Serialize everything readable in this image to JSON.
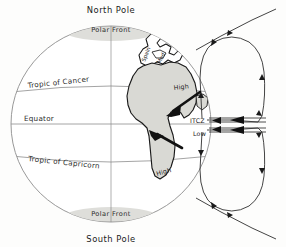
{
  "diagram": {
    "poles": {
      "north": "North Pole",
      "south": "South Pole"
    },
    "fronts": {
      "north_label": "Polar Front",
      "south_label": "Polar Front"
    },
    "latitudes": [
      {
        "id": "tropic-cancer",
        "label": "Tropic of Cancer"
      },
      {
        "id": "equator",
        "label": "Equator"
      },
      {
        "id": "tropic-capricorn",
        "label": "Tropic of Capricorn"
      }
    ],
    "pressure_cells": [
      {
        "id": "high-north",
        "label": "High"
      },
      {
        "id": "itcz",
        "label": "ITCZ"
      },
      {
        "id": "low",
        "label": "Low"
      },
      {
        "id": "high-south",
        "label": "High"
      }
    ],
    "regions": [
      {
        "id": "spain",
        "label": "Spain"
      },
      {
        "id": "mediterranean",
        "label": "Med"
      }
    ],
    "colors": {
      "land_fill": "#d9d9d4",
      "land_stroke": "#1a1a1a",
      "front_fill": "#dededa",
      "globe_stroke": "#8d8d8d",
      "grid_stroke": "#8d8d8d",
      "flow_stroke": "#3a3a3a",
      "arrow_fill": "#111111",
      "background": "#fdfdfc"
    }
  }
}
